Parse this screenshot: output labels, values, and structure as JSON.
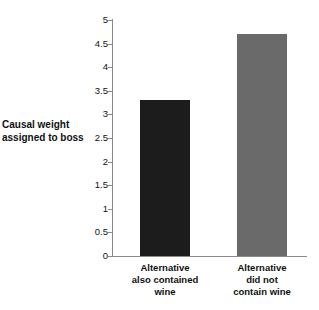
{
  "chart_data": {
    "type": "bar",
    "title": "",
    "subtitle": "",
    "xlabel": "",
    "ylabel": "Causal weight\nassigned to boss",
    "categories": [
      "Alternative\nalso contained\nwine",
      "Alternative\ndid not\ncontain wine"
    ],
    "values": [
      3.3,
      4.7
    ],
    "ylim": [
      0,
      5
    ],
    "yticks": [
      0,
      0.5,
      1,
      1.5,
      2,
      2.5,
      3,
      3.5,
      4,
      4.5,
      5
    ],
    "ytick_labels": [
      "0",
      "0.5",
      "1",
      "1.5",
      "2",
      "2.5",
      "3",
      "3.5",
      "4",
      "4.5",
      "5"
    ],
    "grid": false,
    "legend": false,
    "legend_position": "none",
    "bar_colors": [
      "#1c1c1c",
      "#6a6a6a"
    ],
    "axis_color": "#8a8a8a",
    "background_color": "#ffffff",
    "text_color": "#111111",
    "annotations": []
  }
}
